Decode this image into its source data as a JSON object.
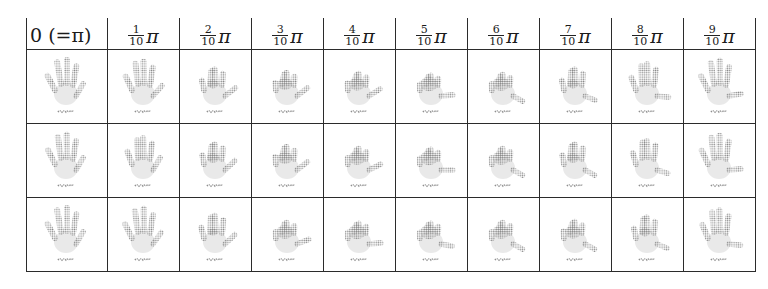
{
  "figure": {
    "header": [
      {
        "type": "text",
        "text": "0 (=π)"
      },
      {
        "type": "frac",
        "num": "1",
        "den": "10",
        "sym": "π"
      },
      {
        "type": "frac",
        "num": "2",
        "den": "10",
        "sym": "π"
      },
      {
        "type": "frac",
        "num": "3",
        "den": "10",
        "sym": "π"
      },
      {
        "type": "frac",
        "num": "4",
        "den": "10",
        "sym": "π"
      },
      {
        "type": "frac",
        "num": "5",
        "den": "10",
        "sym": "π"
      },
      {
        "type": "frac",
        "num": "6",
        "den": "10",
        "sym": "π"
      },
      {
        "type": "frac",
        "num": "7",
        "den": "10",
        "sym": "π"
      },
      {
        "type": "frac",
        "num": "8",
        "den": "10",
        "sym": "π"
      },
      {
        "type": "frac",
        "num": "9",
        "den": "10",
        "sym": "π"
      }
    ],
    "rows": [
      {
        "name": "sequence-1",
        "cells": [
          {
            "icon": "open-hand-image",
            "curl": 0.0,
            "thumb": 0.0
          },
          {
            "icon": "open-hand-image",
            "curl": 0.1,
            "thumb": 0.1
          },
          {
            "icon": "partial-fist-image",
            "curl": 0.55,
            "thumb": 0.2
          },
          {
            "icon": "partial-fist-image",
            "curl": 0.75,
            "thumb": 0.2
          },
          {
            "icon": "partial-fist-image",
            "curl": 0.8,
            "thumb": 0.25
          },
          {
            "icon": "fist-image",
            "curl": 0.9,
            "thumb": 0.5
          },
          {
            "icon": "fist-image",
            "curl": 0.85,
            "thumb": 0.8
          },
          {
            "icon": "partial-fist-image",
            "curl": 0.55,
            "thumb": 0.75
          },
          {
            "icon": "open-hand-image",
            "curl": 0.25,
            "thumb": 0.6
          },
          {
            "icon": "open-hand-image",
            "curl": 0.05,
            "thumb": 0.45
          }
        ]
      },
      {
        "name": "sequence-2",
        "cells": [
          {
            "icon": "open-hand-image",
            "curl": 0.05,
            "thumb": 0.0
          },
          {
            "icon": "open-hand-image",
            "curl": 0.25,
            "thumb": 0.0
          },
          {
            "icon": "partial-fist-image",
            "curl": 0.6,
            "thumb": 0.15
          },
          {
            "icon": "partial-fist-image",
            "curl": 0.75,
            "thumb": 0.2
          },
          {
            "icon": "fist-image",
            "curl": 0.85,
            "thumb": 0.3
          },
          {
            "icon": "fist-image",
            "curl": 0.9,
            "thumb": 0.55
          },
          {
            "icon": "fist-image",
            "curl": 0.85,
            "thumb": 0.8
          },
          {
            "icon": "partial-fist-image",
            "curl": 0.6,
            "thumb": 0.8
          },
          {
            "icon": "partial-fist-image",
            "curl": 0.4,
            "thumb": 0.7
          },
          {
            "icon": "open-hand-image",
            "curl": 0.1,
            "thumb": 0.5
          }
        ]
      },
      {
        "name": "sequence-3",
        "cells": [
          {
            "icon": "open-hand-image",
            "curl": 0.0,
            "thumb": 0.0
          },
          {
            "icon": "open-hand-image",
            "curl": 0.05,
            "thumb": 0.05
          },
          {
            "icon": "partial-fist-image",
            "curl": 0.45,
            "thumb": 0.15
          },
          {
            "icon": "fist-image",
            "curl": 0.85,
            "thumb": 0.35
          },
          {
            "icon": "fist-image",
            "curl": 0.9,
            "thumb": 0.5
          },
          {
            "icon": "fist-image",
            "curl": 0.9,
            "thumb": 0.65
          },
          {
            "icon": "fist-image",
            "curl": 0.85,
            "thumb": 0.8
          },
          {
            "icon": "fist-image",
            "curl": 0.8,
            "thumb": 0.8
          },
          {
            "icon": "partial-fist-image",
            "curl": 0.55,
            "thumb": 0.75
          },
          {
            "icon": "open-hand-image",
            "curl": 0.15,
            "thumb": 0.6
          }
        ]
      }
    ],
    "colors": {
      "grid": "#2b2b2b",
      "dots": "#8a8a8a",
      "palm": "#e9e9e9"
    }
  }
}
